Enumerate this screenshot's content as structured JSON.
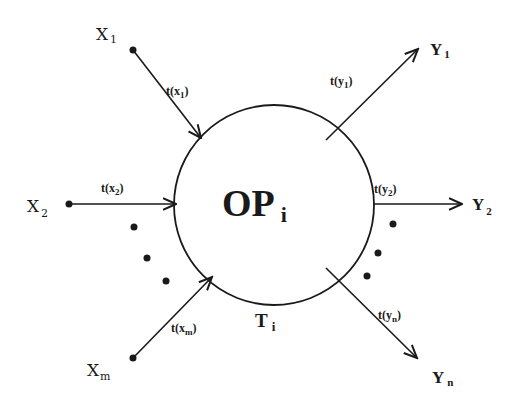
{
  "diagram": {
    "center_label": {
      "main": "OP",
      "sub": "i"
    },
    "time_label": {
      "main": "T",
      "sub": "i"
    },
    "inputs": [
      {
        "main": "X",
        "sub": "1",
        "edge_main": "t(x",
        "edge_sub": "1",
        "edge_close": ")"
      },
      {
        "main": "X",
        "sub": "2",
        "edge_main": "t(x",
        "edge_sub": "2",
        "edge_close": ")"
      },
      {
        "main": "X",
        "sub": "m",
        "edge_main": "t(x",
        "edge_sub": "m",
        "edge_close": ")"
      }
    ],
    "outputs": [
      {
        "main": "Y",
        "sub": "1",
        "edge_main": "t(y",
        "edge_sub": "1",
        "edge_close": ")"
      },
      {
        "main": "Y",
        "sub": "2",
        "edge_main": "t(y",
        "edge_sub": "2",
        "edge_close": ")"
      },
      {
        "main": "Y",
        "sub": "n",
        "edge_main": "t(y",
        "edge_sub": "n",
        "edge_close": ")"
      }
    ],
    "colors": {
      "stroke": "#1a1a1a",
      "background": "#ffffff"
    }
  }
}
